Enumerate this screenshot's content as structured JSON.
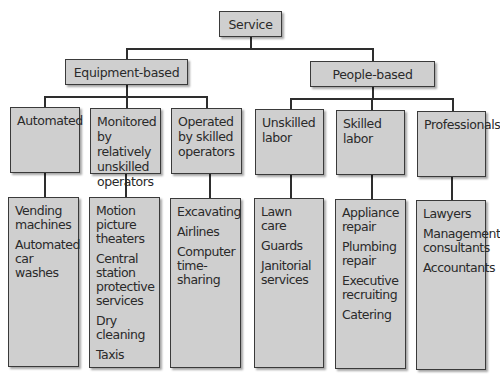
{
  "root": {
    "label": "Service"
  },
  "branches": [
    {
      "label": "Equipment-based",
      "categories": [
        {
          "label": "Automated",
          "examples": [
            "Vending machines",
            "Automated car washes"
          ]
        },
        {
          "label": "Monitored by relatively unskilled operators",
          "examples": [
            "Motion picture theaters",
            "Central station protective services",
            "Dry cleaning",
            "Taxis"
          ]
        },
        {
          "label": "Operated by skilled operators",
          "examples": [
            "Excavating",
            "Airlines",
            "Computer time-sharing"
          ]
        }
      ]
    },
    {
      "label": "People-based",
      "categories": [
        {
          "label": "Unskilled labor",
          "examples": [
            "Lawn care",
            "Guards",
            "Janitorial services"
          ]
        },
        {
          "label": "Skilled labor",
          "examples": [
            "Appliance repair",
            "Plumbing repair",
            "Executive recruiting",
            "Catering"
          ]
        },
        {
          "label": "Professionals",
          "examples": [
            "Lawyers",
            "Management consultants",
            "Accountants"
          ]
        }
      ]
    }
  ],
  "colors": {
    "box_fill": "#cfcfcf",
    "border": "#3a3a3a",
    "background": "#ffffff"
  }
}
